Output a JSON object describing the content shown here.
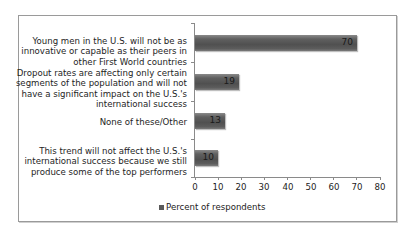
{
  "chart_data": {
    "type": "bar",
    "orientation": "horizontal",
    "title": "",
    "xlabel": "",
    "ylabel": "",
    "categories": [
      "Young men in the U.S. will not be as innovative or capable as their peers in other First World countries",
      "Dropout rates are affecting only certain segments of the population and will not have a significant impact on the U.S.'s international success",
      "None of these/Other",
      "This trend will not affect the U.S.'s international success because we still produce some of the top performers"
    ],
    "category_lines": [
      [
        "Young men in the U.S. will not be as",
        "innovative or capable as their peers in",
        "other First World countries"
      ],
      [
        "Dropout rates are affecting only certain",
        "segments of the population and will not",
        "have a significant impact on the U.S.'s",
        "international success"
      ],
      [
        "None of these/Other"
      ],
      [
        "This trend will not affect the U.S.'s",
        "international success because we still",
        "produce some of the top performers"
      ]
    ],
    "series": [
      {
        "name": "Percent of respondents",
        "values": [
          70,
          19,
          13,
          10
        ],
        "color": "#5a5a5a"
      }
    ],
    "value_labels": [
      "70",
      "19",
      "13",
      "10"
    ],
    "xlim": [
      0,
      80
    ],
    "xticks": [
      "0",
      "10",
      "20",
      "30",
      "40",
      "50",
      "60",
      "70",
      "80"
    ],
    "grid": false,
    "legend": {
      "position": "bottom",
      "entries": [
        "Percent of respondents"
      ]
    }
  }
}
